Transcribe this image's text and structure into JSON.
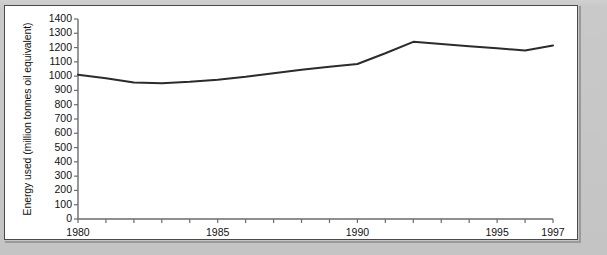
{
  "chart_data": {
    "type": "line",
    "title": "",
    "xlabel": "",
    "ylabel": "Energy used (million tonnes oil equivalent)",
    "xlim": [
      1980,
      1997
    ],
    "ylim": [
      0,
      1400
    ],
    "grid": false,
    "legend": null,
    "y_ticks": [
      0,
      100,
      200,
      300,
      400,
      500,
      600,
      700,
      800,
      900,
      1000,
      1100,
      1200,
      1300,
      1400
    ],
    "y_tick_labels": [
      "0",
      "100",
      "200",
      "300",
      "400",
      "500",
      "600",
      "700",
      "800",
      "900",
      "1000",
      "1100",
      "1200",
      "1300",
      "1400"
    ],
    "x_ticks": [
      1980,
      1981,
      1982,
      1983,
      1984,
      1985,
      1986,
      1987,
      1988,
      1989,
      1990,
      1991,
      1992,
      1993,
      1994,
      1995,
      1996,
      1997
    ],
    "x_tick_labels": [
      {
        "x": 1980,
        "label": "1980"
      },
      {
        "x": 1985,
        "label": "1985"
      },
      {
        "x": 1990,
        "label": "1990"
      },
      {
        "x": 1995,
        "label": "1995"
      },
      {
        "x": 1997,
        "label": "1997"
      }
    ],
    "x": [
      1980,
      1981,
      1982,
      1983,
      1984,
      1985,
      1986,
      1987,
      1988,
      1989,
      1990,
      1991,
      1992,
      1993,
      1994,
      1995,
      1996,
      1997
    ],
    "values": [
      1010,
      985,
      955,
      950,
      960,
      975,
      995,
      1020,
      1045,
      1065,
      1085,
      1160,
      1240,
      1225,
      1210,
      1195,
      1180,
      1215
    ],
    "line_color": "#2b2b2b",
    "line_width": 2,
    "markers": false,
    "axis_color": "#6b6b6b",
    "background_color": "#ffffff"
  }
}
